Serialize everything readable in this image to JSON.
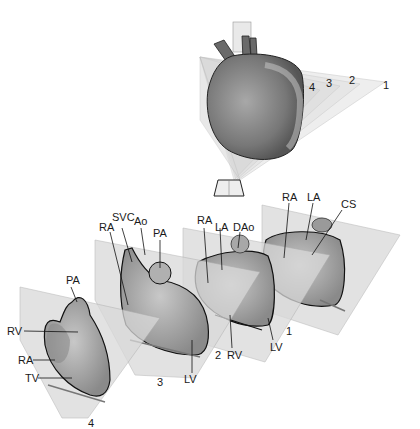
{
  "overview": {
    "plane_numbers": [
      "1",
      "2",
      "3",
      "4"
    ]
  },
  "sections": [
    {
      "plane": "4",
      "labels": [
        "PA",
        "RV",
        "RA",
        "TV"
      ]
    },
    {
      "plane": "3",
      "labels": [
        "RA",
        "SVC",
        "Ao",
        "PA",
        "LV"
      ]
    },
    {
      "plane": "2",
      "labels": [
        "RA",
        "LA",
        "DAo",
        "RV",
        "LV"
      ]
    },
    {
      "plane": "1",
      "labels": [
        "RA",
        "LA",
        "CS",
        "LV"
      ]
    }
  ],
  "colors": {
    "plane_fill": "#d9d9d9",
    "heart_dark": "#6e6e6e",
    "heart_mid": "#9a9a9a",
    "heart_light": "#c4c4c4",
    "outline": "#1a1a1a"
  }
}
